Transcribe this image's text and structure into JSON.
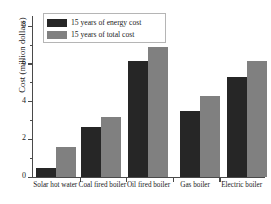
{
  "chart_data": {
    "type": "bar",
    "title": "",
    "xlabel": "",
    "ylabel": "Cost (million dollars)",
    "categories": [
      "Solar hot water",
      "Coal fired boiler",
      "Oil fired boiler",
      "Gas boiler",
      "Electric boiler"
    ],
    "series": [
      {
        "name": "15 years of energy cost",
        "color": "#262626",
        "values": [
          0.5,
          2.65,
          6.15,
          3.5,
          5.3
        ]
      },
      {
        "name": "15 years of total  cost",
        "color": "#808080",
        "values": [
          1.6,
          3.2,
          6.9,
          4.3,
          6.15
        ]
      }
    ],
    "ylim": [
      0,
      8.6
    ],
    "yticks": [
      0,
      2,
      4,
      6,
      8
    ],
    "ytick_labels": [
      "0",
      "2",
      "4",
      "6",
      "8"
    ],
    "yminor_ticks": [
      1,
      3,
      5,
      7
    ],
    "grid": false,
    "legend_position": "upper-left",
    "background": "#ffffff",
    "axis_color": "#4a4a4a"
  },
  "legend": {
    "entries": [
      {
        "label": "15 years of energy cost"
      },
      {
        "label": "15 years of total  cost"
      }
    ]
  }
}
